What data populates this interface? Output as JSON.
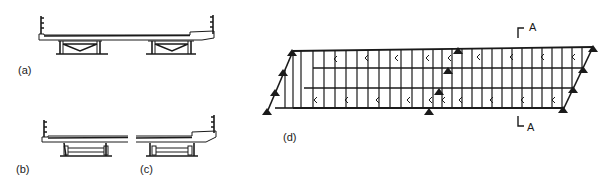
{
  "figure": {
    "panels": [
      {
        "id": "a",
        "label": "(a)",
        "description": "Full bridge deck cross-section with two braced girder pairs"
      },
      {
        "id": "b",
        "label": "(b)",
        "description": "Left half of deck cross-section with single girder pair"
      },
      {
        "id": "c",
        "label": "(c)",
        "description": "Right half of deck cross-section with single girder pair"
      },
      {
        "id": "d",
        "label": "(d)",
        "description": "Skewed grillage plan with supports"
      }
    ],
    "section_marker": {
      "top": "A",
      "bottom": "A"
    },
    "colors": {
      "ink": "#1a1a1a",
      "background": "#ffffff"
    }
  }
}
